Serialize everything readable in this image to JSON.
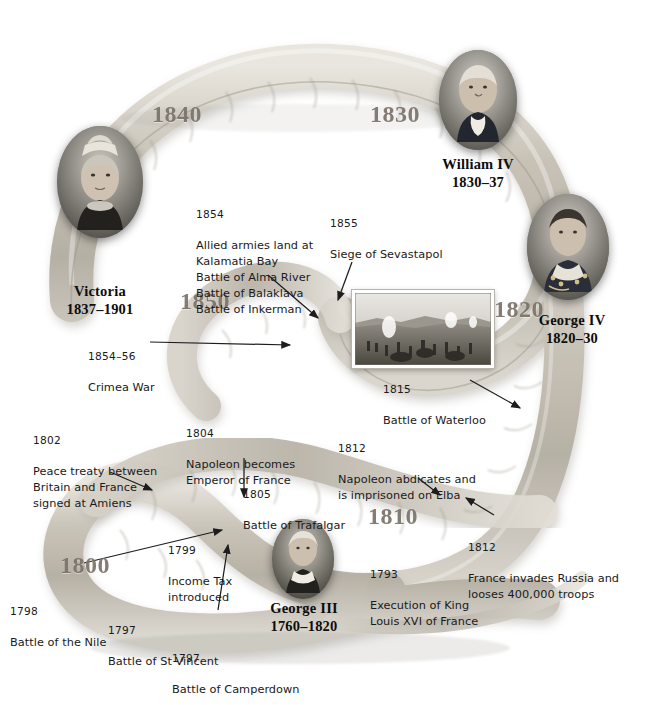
{
  "page": {
    "background_color": "#ffffff",
    "ribbon_color": "#b9b3a8",
    "decade_color": "#7b736a",
    "text_color": "#1a1a1a"
  },
  "decades": [
    {
      "label": "1840",
      "x": 152,
      "y": 101
    },
    {
      "label": "1830",
      "x": 370,
      "y": 101
    },
    {
      "label": "1850",
      "x": 180,
      "y": 288
    },
    {
      "label": "1820",
      "x": 494,
      "y": 296
    },
    {
      "label": "1810",
      "x": 368,
      "y": 503
    },
    {
      "label": "1800",
      "x": 60,
      "y": 552
    }
  ],
  "monarchs": [
    {
      "id": "william-iv",
      "name": "William IV",
      "reign": "1830–37",
      "portrait_icon": "portrait-william-iv",
      "portrait": {
        "x": 439,
        "y": 50,
        "w": 78,
        "h": 100
      },
      "label": {
        "x": 417,
        "y": 156,
        "w": 122
      }
    },
    {
      "id": "victoria",
      "name": "Victoria",
      "reign": "1837–1901",
      "portrait_icon": "portrait-victoria",
      "portrait": {
        "x": 57,
        "y": 126,
        "w": 86,
        "h": 112
      },
      "label": {
        "x": 32,
        "y": 283,
        "w": 136
      }
    },
    {
      "id": "george-iv",
      "name": "George IV",
      "reign": "1820–30",
      "portrait_icon": "portrait-george-iv",
      "portrait": {
        "x": 527,
        "y": 194,
        "w": 82,
        "h": 106
      },
      "label": {
        "x": 510,
        "y": 312,
        "w": 124
      }
    },
    {
      "id": "george-iii",
      "name": "George III",
      "reign": "1760–1820",
      "portrait_icon": "portrait-george-iii",
      "portrait": {
        "x": 272,
        "y": 519,
        "w": 62,
        "h": 80
      },
      "label": {
        "x": 244,
        "y": 600,
        "w": 120
      }
    }
  ],
  "events": [
    {
      "id": "crimea-allied-landing",
      "year": "1854",
      "body": "Allied armies land at\nKalamatia Bay\nBattle of Alma River\nBattle of Balaklava\nBattle of Inkerman",
      "x": 196,
      "y": 191,
      "w": 160
    },
    {
      "id": "siege-of-sevastapol",
      "year": "1855",
      "body": "Siege of Sevastapol",
      "x": 330,
      "y": 200,
      "w": 140
    },
    {
      "id": "crimea-war",
      "year": "1854–56",
      "body": "Crimea War",
      "x": 88,
      "y": 333,
      "w": 110
    },
    {
      "id": "battle-of-waterloo",
      "year": "1815",
      "body": "Battle of Waterloo",
      "x": 383,
      "y": 366,
      "w": 140
    },
    {
      "id": "peace-treaty-amiens",
      "year": "1802",
      "body": "Peace treaty between\nBritain and France\nsigned at Amiens",
      "x": 33,
      "y": 417,
      "w": 150
    },
    {
      "id": "napoleon-emperor",
      "year": "1804",
      "body": "Napoleon becomes\nEmperor of France",
      "x": 186,
      "y": 410,
      "w": 140
    },
    {
      "id": "napoleon-abdicates",
      "year": "1812",
      "body": "Napoleon abdicates and\nis imprisoned on Elba",
      "x": 338,
      "y": 425,
      "w": 160
    },
    {
      "id": "battle-of-trafalgar",
      "year": "1805",
      "body": "Battle of Trafalgar",
      "x": 243,
      "y": 471,
      "w": 140
    },
    {
      "id": "france-invades-russia",
      "year": "1812",
      "body": "France invades Russia and\nlooses 400,000 troops",
      "x": 468,
      "y": 524,
      "w": 176
    },
    {
      "id": "income-tax",
      "year": "1799",
      "body": "Income Tax\nintroduced",
      "x": 168,
      "y": 527,
      "w": 100
    },
    {
      "id": "execution-louis-xvi",
      "year": "1793",
      "body": "Execution of King\nLouis XVI of France",
      "x": 370,
      "y": 551,
      "w": 140
    },
    {
      "id": "battle-of-the-nile",
      "year": "1798",
      "body": "Battle of the Nile",
      "x": 10,
      "y": 588,
      "w": 130
    },
    {
      "id": "battle-of-st-vincent",
      "year": "1797",
      "body": "Battle of St Vincent",
      "x": 108,
      "y": 607,
      "w": 140
    },
    {
      "id": "battle-of-camperdown",
      "year": "1797",
      "body": "Battle of Camperdown",
      "x": 172,
      "y": 635,
      "w": 156
    }
  ],
  "inset": {
    "id": "siege-engraving",
    "caption_icon": "battle-engraving",
    "x": 352,
    "y": 290,
    "w": 136,
    "h": 72
  }
}
